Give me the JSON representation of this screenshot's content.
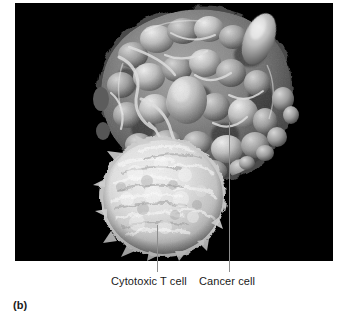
{
  "figure": {
    "panel_letter": "(b)",
    "panel_letter_name": "panel-label-b"
  },
  "photo": {
    "alt_description": "Scanning electron micrograph of a cytotoxic T cell attacking a cancer cell",
    "background_color": "#000000",
    "subjects": [
      {
        "name": "cancer-cell",
        "label": "Cancer cell",
        "appearance": "large irregular mass with blebbed, vesicle-covered surface",
        "tone": "mid-gray",
        "color_mid": "#7c7c7c",
        "color_highlight": "#cfcfcf",
        "color_shadow": "#2a2a2a"
      },
      {
        "name": "cytotoxic-t-cell",
        "label": "Cytotoxic T cell",
        "appearance": "bright rounded sphere with rough villous surface",
        "tone": "bright near-white",
        "color_mid": "#dcdcdc",
        "color_highlight": "#f4f4f4",
        "color_shadow": "#8e8e8e"
      }
    ]
  },
  "labels": {
    "t_cell": "Cytotoxic T cell",
    "cancer_cell": "Cancer cell",
    "leader_line_color": "#8e8e8e"
  }
}
